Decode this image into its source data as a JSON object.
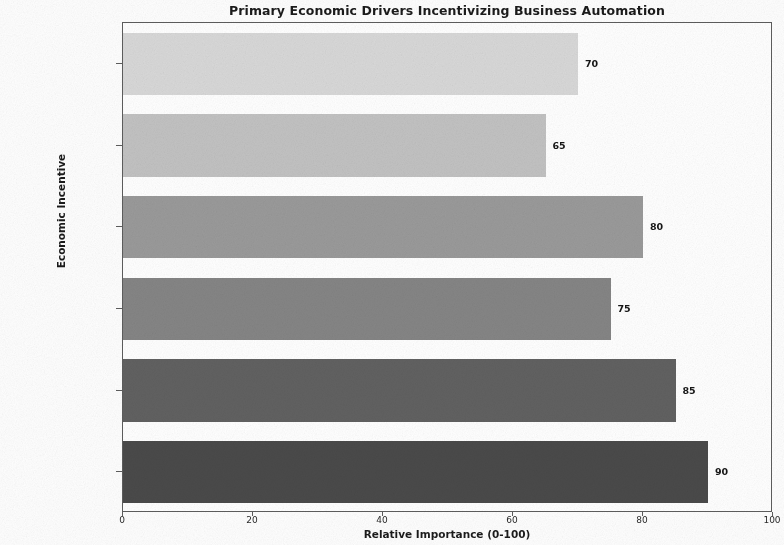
{
  "chart_data": {
    "type": "bar",
    "orientation": "horizontal",
    "title": "Primary Economic Drivers Incentivizing Business Automation",
    "xlabel": "Relative Importance (0-100)",
    "ylabel": "Economic Incentive",
    "categories": [
      "Cost Reduction",
      "Productivity Gains",
      "Quality Improvement",
      "Competitive Advantage",
      "Risk Reduction",
      "Scalability"
    ],
    "values": [
      90,
      85,
      75,
      80,
      65,
      70
    ],
    "bar_colors": [
      "#4a4a4a",
      "#616161",
      "#858585",
      "#9a9a9a",
      "#c2c2c2",
      "#d8d8d8"
    ],
    "value_labels": [
      "90",
      "85",
      "75",
      "80",
      "65",
      "70"
    ],
    "xlim": [
      0,
      100
    ],
    "xticks": [
      0,
      20,
      40,
      60,
      80,
      100
    ],
    "xtick_labels": [
      "0",
      "20",
      "40",
      "60",
      "80",
      "100"
    ],
    "grid": false,
    "legend": "none",
    "display_order_top_to_bottom": [
      "Scalability",
      "Risk Reduction",
      "Competitive Advantage",
      "Quality Improvement",
      "Productivity Gains",
      "Cost Reduction"
    ]
  }
}
